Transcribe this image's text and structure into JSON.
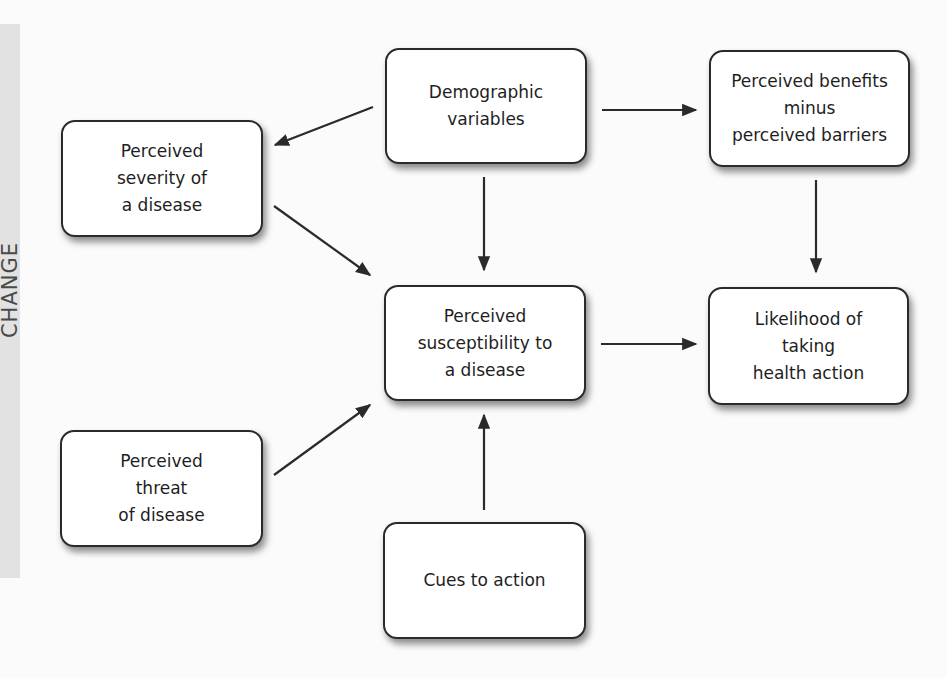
{
  "sidebar": {
    "label": "CHANGE"
  },
  "diagram": {
    "nodes": {
      "demographic": {
        "label": "Demographic\nvariables"
      },
      "severity": {
        "label": "Perceived\nseverity of\na disease"
      },
      "benefits": {
        "label": "Perceived benefits\nminus\nperceived barriers"
      },
      "susceptibility": {
        "label": "Perceived\nsusceptibility to\na disease"
      },
      "likelihood": {
        "label": "Likelihood of\ntaking\nhealth action"
      },
      "threat": {
        "label": "Perceived\nthreat\nof disease"
      },
      "cues": {
        "label": "Cues to action"
      }
    },
    "edges": [
      {
        "from": "demographic",
        "to": "severity"
      },
      {
        "from": "demographic",
        "to": "benefits"
      },
      {
        "from": "demographic",
        "to": "susceptibility"
      },
      {
        "from": "severity",
        "to": "susceptibility"
      },
      {
        "from": "threat",
        "to": "susceptibility"
      },
      {
        "from": "cues",
        "to": "susceptibility"
      },
      {
        "from": "susceptibility",
        "to": "likelihood"
      },
      {
        "from": "benefits",
        "to": "likelihood"
      }
    ],
    "colors": {
      "stroke": "#2a2a2a",
      "box_fill": "#ffffff",
      "band": "#e2e2e2"
    }
  }
}
